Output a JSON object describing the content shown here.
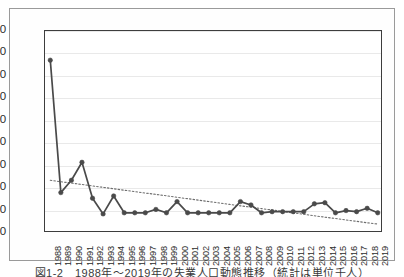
{
  "chart_data": {
    "type": "line",
    "title": "",
    "subtitle": "",
    "xlabel": "",
    "ylabel": "",
    "xlim": [
      1988,
      2019
    ],
    "ylim": [
      -20,
      160
    ],
    "ytick_step": 20,
    "grid": true,
    "legend": false,
    "legend_position": "none",
    "categories": [
      "1988",
      "1989",
      "1990",
      "1991",
      "1992",
      "1993",
      "1994",
      "1995",
      "1996",
      "1997",
      "1998",
      "1999",
      "2000",
      "2001",
      "2002",
      "2003",
      "2004",
      "2005",
      "2006",
      "2007",
      "2008",
      "2009",
      "2010",
      "2011",
      "2012",
      "2013",
      "2014",
      "2015",
      "2016",
      "2017",
      "2018",
      "2019"
    ],
    "yticks": [
      "-20",
      "0",
      "20",
      "40",
      "60",
      "80",
      "100",
      "120",
      "140",
      "160"
    ],
    "series": [
      {
        "name": "data",
        "style": "solid-line-with-markers",
        "color": "#4a4a4a",
        "values": [
          134,
          16,
          27,
          43,
          11,
          -3,
          13,
          -2,
          -2,
          -2,
          1,
          -2,
          8,
          -2,
          -2,
          -2,
          -2,
          -2,
          8,
          5,
          -2,
          -1,
          -1,
          -1,
          -1,
          6,
          7,
          -2,
          0,
          -1,
          2,
          -2
        ]
      },
      {
        "name": "trendline",
        "style": "dotted-linear-trend",
        "color": "#6e6e6e",
        "endpoints": [
          27,
          -12
        ],
        "values": [
          27,
          25.7,
          24.5,
          23.2,
          21.9,
          20.7,
          19.4,
          18.1,
          16.9,
          15.6,
          14.4,
          13.1,
          11.8,
          10.6,
          9.3,
          8.0,
          6.8,
          5.5,
          4.2,
          3.0,
          1.7,
          0.5,
          -0.8,
          -2.1,
          -3.3,
          -4.6,
          -5.9,
          -7.1,
          -8.4,
          -9.6,
          -10.9,
          -12
        ]
      }
    ]
  },
  "caption": {
    "text": "図1-2　1988年～2019年の失業人口動態推移（統計は単位千人）"
  }
}
